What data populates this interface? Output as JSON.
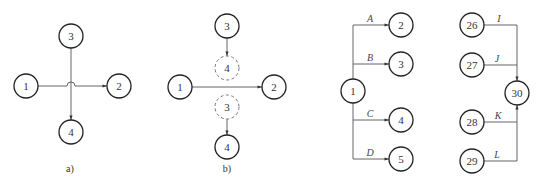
{
  "diagrams": {
    "a": {
      "caption": "a)",
      "nodes": {
        "n1": "1",
        "n2": "2",
        "n3": "3",
        "n4": "4"
      },
      "edges": [
        {
          "from": "1",
          "to": "2",
          "note": "crosses over 3→4 with a hop"
        },
        {
          "from": "3",
          "to": "4"
        }
      ]
    },
    "b": {
      "caption": "b)",
      "nodes": {
        "n1": "1",
        "n2": "2",
        "n3": "3",
        "n4": "4",
        "virtual4": "4",
        "virtual3": "3"
      },
      "edges": [
        {
          "from": "1",
          "to": "2"
        },
        {
          "from": "3",
          "to": "4 (virtual)"
        },
        {
          "from": "3 (virtual)",
          "to": "4"
        }
      ]
    },
    "c": {
      "nodes": {
        "n1": "1",
        "n2": "2",
        "n3": "3",
        "n4": "4",
        "n5": "5"
      },
      "edges": [
        {
          "from": "1",
          "to": "2",
          "label": "A"
        },
        {
          "from": "1",
          "to": "3",
          "label": "B"
        },
        {
          "from": "1",
          "to": "4",
          "label": "C"
        },
        {
          "from": "1",
          "to": "5",
          "label": "D"
        }
      ]
    },
    "d": {
      "nodes": {
        "n26": "26",
        "n27": "27",
        "n28": "28",
        "n29": "29",
        "n30": "30"
      },
      "edges": [
        {
          "from": "26",
          "to": "30",
          "label": "I"
        },
        {
          "from": "27",
          "to": "30",
          "label": "J"
        },
        {
          "from": "28",
          "to": "30",
          "label": "K"
        },
        {
          "from": "29",
          "to": "30",
          "label": "L"
        }
      ]
    }
  }
}
